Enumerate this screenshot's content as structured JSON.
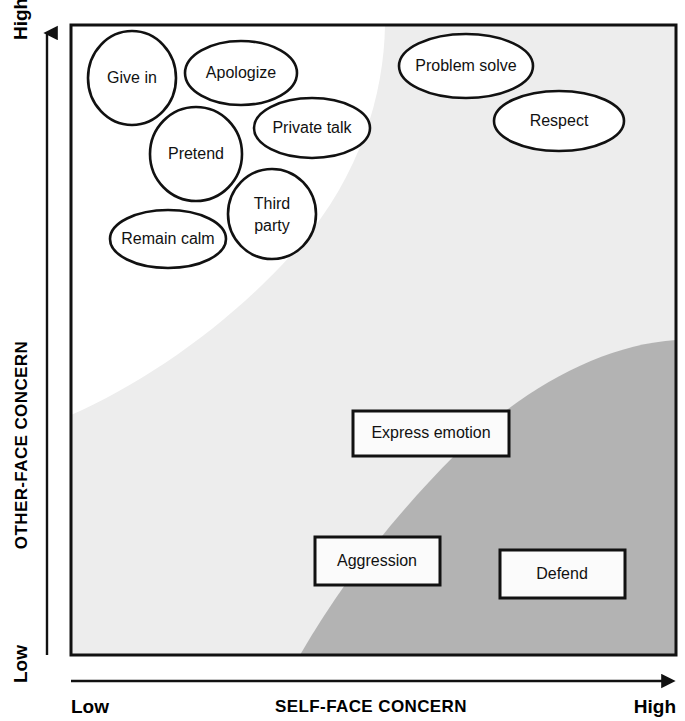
{
  "diagram": {
    "x_axis": {
      "name": "SELF-FACE CONCERN",
      "low_label": "Low",
      "high_label": "High"
    },
    "y_axis": {
      "name": "OTHER-FACE CONCERN",
      "low_label": "Low",
      "high_label": "High"
    },
    "colors": {
      "background": "#ffffff",
      "region_light": "#ededed",
      "region_dark": "#b3b3b3",
      "outline": "#111111",
      "text": "#111111"
    },
    "regions": [
      {
        "id": "region-white",
        "label": "",
        "fill": "#ffffff"
      },
      {
        "id": "region-light-gray",
        "label": "",
        "fill": "#ededed"
      },
      {
        "id": "region-dark-gray",
        "label": "",
        "fill": "#b3b3b3"
      }
    ],
    "ellipse_nodes": [
      {
        "id": "give-in",
        "label": "Give in",
        "cx": 132,
        "cy": 78,
        "rx": 44,
        "ry": 47,
        "lines": [
          "Give in"
        ]
      },
      {
        "id": "apologize",
        "label": "Apologize",
        "cx": 241,
        "cy": 73,
        "rx": 56,
        "ry": 32,
        "lines": [
          "Apologize"
        ]
      },
      {
        "id": "private-talk",
        "label": "Private talk",
        "cx": 312,
        "cy": 128,
        "rx": 58,
        "ry": 30,
        "lines": [
          "Private talk"
        ]
      },
      {
        "id": "pretend",
        "label": "Pretend",
        "cx": 196,
        "cy": 154,
        "rx": 46,
        "ry": 47,
        "lines": [
          "Pretend"
        ]
      },
      {
        "id": "third-party",
        "label": "Third party",
        "cx": 272,
        "cy": 214,
        "rx": 44,
        "ry": 45,
        "lines": [
          "Third",
          "party"
        ]
      },
      {
        "id": "remain-calm",
        "label": "Remain calm",
        "cx": 168,
        "cy": 239,
        "rx": 58,
        "ry": 29,
        "lines": [
          "Remain calm"
        ]
      },
      {
        "id": "problem-solve",
        "label": "Problem solve",
        "cx": 466,
        "cy": 66,
        "rx": 67,
        "ry": 32,
        "lines": [
          "Problem solve"
        ]
      },
      {
        "id": "respect",
        "label": "Respect",
        "cx": 559,
        "cy": 121,
        "rx": 65,
        "ry": 30,
        "lines": [
          "Respect"
        ]
      }
    ],
    "box_nodes": [
      {
        "id": "express-emotion",
        "label": "Express emotion",
        "x": 353,
        "y": 411,
        "w": 156,
        "h": 45
      },
      {
        "id": "aggression",
        "label": "Aggression",
        "x": 315,
        "y": 537,
        "w": 125,
        "h": 48
      },
      {
        "id": "defend",
        "label": "Defend",
        "x": 500,
        "y": 550,
        "w": 125,
        "h": 48
      }
    ]
  }
}
